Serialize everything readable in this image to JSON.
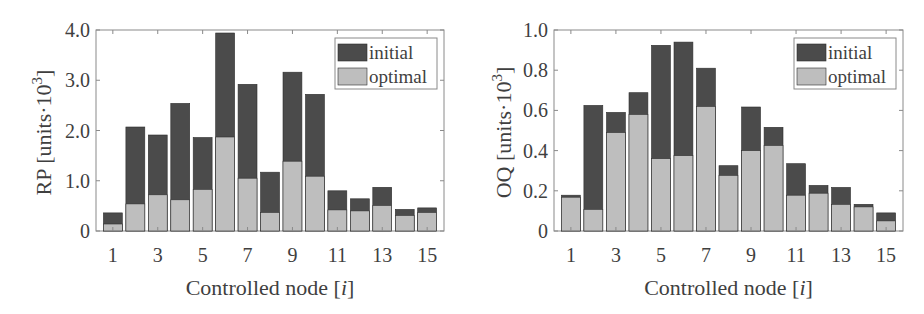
{
  "figure": {
    "colors": {
      "initial": "#4b4b4b",
      "optimal": "#bebebe",
      "bar_edge": "#2e2e2e",
      "axis": "#8a8a8a",
      "text": "#3f3f3f"
    }
  },
  "chart_data": [
    {
      "type": "bar",
      "stacking": "overlay",
      "title": "",
      "xlabel": "Controlled node [i]",
      "xlabel_parts": {
        "prefix": "Controlled node [",
        "italic": "i",
        "suffix": "]"
      },
      "ylabel": "RP [units·10^3]",
      "ylabel_parts": {
        "prefix": "RP [units·10",
        "sup": "3",
        "suffix": "]"
      },
      "ylim": [
        0,
        4.0
      ],
      "yticks": [
        0,
        1.0,
        2.0,
        3.0,
        4.0
      ],
      "ytick_labels": [
        "0",
        "1.0",
        "2.0",
        "3.0",
        "4.0"
      ],
      "categories": [
        1,
        2,
        3,
        4,
        5,
        6,
        7,
        8,
        9,
        10,
        11,
        12,
        13,
        14,
        15
      ],
      "xtick_labels": [
        "1",
        "3",
        "5",
        "7",
        "9",
        "11",
        "13",
        "15"
      ],
      "xticks": [
        1,
        3,
        5,
        7,
        9,
        11,
        13,
        15
      ],
      "grid": false,
      "legend": {
        "position": "upper right",
        "entries": [
          "initial",
          "optimal"
        ]
      },
      "series": [
        {
          "name": "initial",
          "values": [
            0.36,
            2.07,
            1.91,
            2.54,
            1.86,
            3.94,
            2.92,
            1.17,
            3.16,
            2.72,
            0.8,
            0.64,
            0.87,
            0.43,
            0.46
          ]
        },
        {
          "name": "optimal",
          "values": [
            0.14,
            0.54,
            0.72,
            0.62,
            0.83,
            1.87,
            1.05,
            0.37,
            1.39,
            1.09,
            0.42,
            0.4,
            0.51,
            0.31,
            0.37
          ]
        }
      ]
    },
    {
      "type": "bar",
      "stacking": "overlay",
      "title": "",
      "xlabel": "Controlled node [i]",
      "xlabel_parts": {
        "prefix": "Controlled node [",
        "italic": "i",
        "suffix": "]"
      },
      "ylabel": "OQ [units·10^3]",
      "ylabel_parts": {
        "prefix": "OQ [units·10",
        "sup": "3",
        "suffix": "]"
      },
      "ylim": [
        0,
        1.0
      ],
      "yticks": [
        0,
        0.2,
        0.4,
        0.6,
        0.8,
        1.0
      ],
      "ytick_labels": [
        "0",
        "0.2",
        "0.4",
        "0.6",
        "0.8",
        "1.0"
      ],
      "categories": [
        1,
        2,
        3,
        4,
        5,
        6,
        7,
        8,
        9,
        10,
        11,
        12,
        13,
        14,
        15
      ],
      "xtick_labels": [
        "1",
        "3",
        "5",
        "7",
        "9",
        "11",
        "13",
        "15"
      ],
      "xticks": [
        1,
        3,
        5,
        7,
        9,
        11,
        13,
        15
      ],
      "grid": false,
      "legend": {
        "position": "upper right",
        "entries": [
          "initial",
          "optimal"
        ]
      },
      "series": [
        {
          "name": "initial",
          "values": [
            0.178,
            0.625,
            0.59,
            0.688,
            0.924,
            0.94,
            0.81,
            0.325,
            0.617,
            0.516,
            0.335,
            0.227,
            0.217,
            0.133,
            0.09
          ]
        },
        {
          "name": "optimal",
          "values": [
            0.168,
            0.108,
            0.49,
            0.58,
            0.36,
            0.375,
            0.62,
            0.277,
            0.4,
            0.426,
            0.178,
            0.188,
            0.133,
            0.12,
            0.05
          ]
        }
      ]
    }
  ]
}
